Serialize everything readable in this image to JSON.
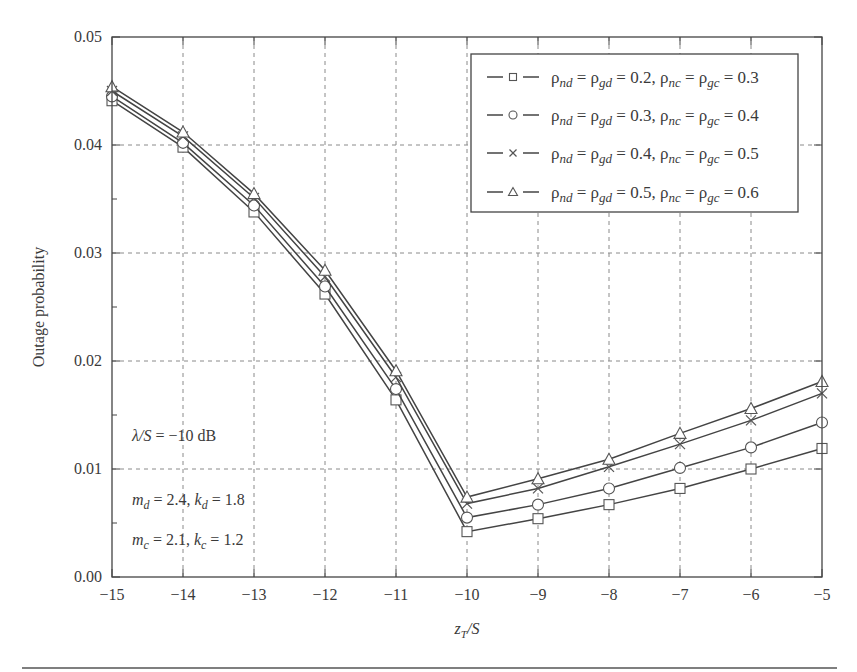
{
  "chart_data": {
    "type": "line",
    "title": "",
    "xlabel": "z_T/S",
    "ylabel": "Outage probability",
    "xlim": [
      -15,
      -5
    ],
    "ylim": [
      0.0,
      0.05
    ],
    "grid": true,
    "legend_position": "upper right",
    "x": [
      -15,
      -14,
      -13,
      -12,
      -11,
      -10,
      -9,
      -8,
      -7,
      -6,
      -5
    ],
    "x_tick_labels": [
      "−15",
      "−14",
      "−13",
      "−12",
      "−11",
      "−10",
      "−9",
      "−8",
      "−7",
      "−6",
      "−5"
    ],
    "y_ticks": [
      0.0,
      0.01,
      0.02,
      0.03,
      0.04,
      0.05
    ],
    "y_tick_labels": [
      "0.00",
      "0.01",
      "0.02",
      "0.03",
      "0.04",
      "0.05"
    ],
    "series": [
      {
        "name": "ρnd = ρgd = 0.2, ρnc = ρgc = 0.3",
        "marker": "square",
        "values": [
          0.0441,
          0.0398,
          0.0338,
          0.0262,
          0.0164,
          0.0042,
          0.0054,
          0.0067,
          0.0082,
          0.01,
          0.0119
        ]
      },
      {
        "name": "ρnd = ρgd = 0.3, ρnc = ρgc = 0.4",
        "marker": "circle",
        "values": [
          0.0445,
          0.0402,
          0.0344,
          0.0269,
          0.0174,
          0.0055,
          0.0067,
          0.0082,
          0.0101,
          0.012,
          0.0143
        ]
      },
      {
        "name": "ρnd = ρgd = 0.4, ρnc = ρgc = 0.5",
        "marker": "cross",
        "values": [
          0.045,
          0.0408,
          0.0351,
          0.0278,
          0.0185,
          0.0068,
          0.0082,
          0.0102,
          0.0123,
          0.0145,
          0.017
        ]
      },
      {
        "name": "ρnd = ρgd = 0.5, ρnc = ρgc = 0.6",
        "marker": "triangle",
        "values": [
          0.0454,
          0.0412,
          0.0355,
          0.0284,
          0.0191,
          0.0074,
          0.0091,
          0.0109,
          0.0133,
          0.0156,
          0.0181
        ]
      }
    ],
    "legend": [
      {
        "rho_nd_gd": "0.2",
        "rho_nc_gc": "0.3"
      },
      {
        "rho_nd_gd": "0.3",
        "rho_nc_gc": "0.4"
      },
      {
        "rho_nd_gd": "0.4",
        "rho_nc_gc": "0.5"
      },
      {
        "rho_nd_gd": "0.5",
        "rho_nc_gc": "0.6"
      }
    ],
    "annotations": [
      {
        "lhs": "λ/S",
        "rhs": "−10 dB"
      },
      {
        "m_sym": "m",
        "m_sub": "d",
        "m_val": "2.4",
        "k_sym": "k",
        "k_sub": "d",
        "k_val": "1.8"
      },
      {
        "m_sym": "m",
        "m_sub": "c",
        "m_val": "2.1",
        "k_sym": "k",
        "k_sub": "c",
        "k_val": "1.2"
      }
    ]
  }
}
